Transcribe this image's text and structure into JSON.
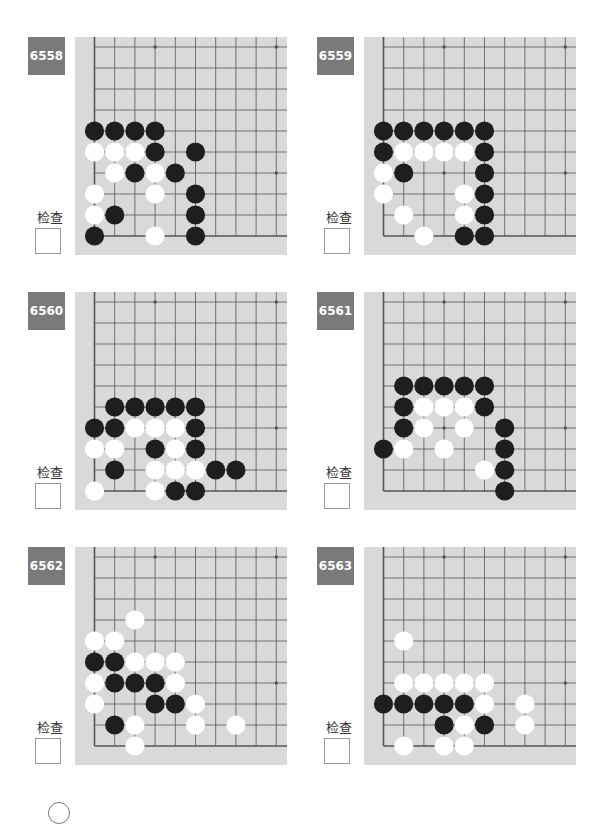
{
  "check_label": "检查",
  "colors": {
    "board_bg": "#d9d9d9",
    "label_bg": "#7a7a7a",
    "line": "#555555",
    "black_stone": "#1e1e1e",
    "white_stone": "#ffffff"
  },
  "board_geometry": {
    "cols": 10,
    "rows": 10,
    "col_spacing": 20.2,
    "row_spacing": 21,
    "origin_note": "bottom-left corner; col 0 = left edge, row 0 = bottom edge"
  },
  "star_points": [
    [
      3,
      9
    ],
    [
      9,
      9
    ],
    [
      3,
      3
    ],
    [
      9,
      3
    ]
  ],
  "problems": [
    {
      "number": "6558",
      "black": [
        [
          0,
          5
        ],
        [
          1,
          5
        ],
        [
          2,
          5
        ],
        [
          3,
          5
        ],
        [
          3,
          4
        ],
        [
          5,
          4
        ],
        [
          2,
          3
        ],
        [
          4,
          3
        ],
        [
          5,
          2
        ],
        [
          1,
          1
        ],
        [
          5,
          1
        ],
        [
          0,
          0
        ],
        [
          5,
          0
        ]
      ],
      "white": [
        [
          0,
          4
        ],
        [
          1,
          4
        ],
        [
          2,
          4
        ],
        [
          1,
          3
        ],
        [
          3,
          3
        ],
        [
          0,
          2
        ],
        [
          3,
          2
        ],
        [
          0,
          1
        ],
        [
          3,
          0
        ]
      ]
    },
    {
      "number": "6559",
      "black": [
        [
          0,
          5
        ],
        [
          1,
          5
        ],
        [
          2,
          5
        ],
        [
          3,
          5
        ],
        [
          4,
          5
        ],
        [
          5,
          5
        ],
        [
          0,
          4
        ],
        [
          5,
          4
        ],
        [
          1,
          3
        ],
        [
          5,
          3
        ],
        [
          5,
          2
        ],
        [
          5,
          1
        ],
        [
          4,
          0
        ],
        [
          5,
          0
        ]
      ],
      "white": [
        [
          1,
          4
        ],
        [
          2,
          4
        ],
        [
          3,
          4
        ],
        [
          4,
          4
        ],
        [
          0,
          3
        ],
        [
          0,
          2
        ],
        [
          4,
          2
        ],
        [
          1,
          1
        ],
        [
          4,
          1
        ],
        [
          2,
          0
        ]
      ]
    },
    {
      "number": "6560",
      "black": [
        [
          1,
          4
        ],
        [
          2,
          4
        ],
        [
          3,
          4
        ],
        [
          4,
          4
        ],
        [
          5,
          4
        ],
        [
          0,
          3
        ],
        [
          1,
          3
        ],
        [
          5,
          3
        ],
        [
          3,
          2
        ],
        [
          5,
          2
        ],
        [
          1,
          1
        ],
        [
          6,
          1
        ],
        [
          7,
          1
        ],
        [
          4,
          0
        ],
        [
          5,
          0
        ]
      ],
      "white": [
        [
          2,
          3
        ],
        [
          3,
          3
        ],
        [
          4,
          3
        ],
        [
          0,
          2
        ],
        [
          1,
          2
        ],
        [
          4,
          2
        ],
        [
          3,
          1
        ],
        [
          4,
          1
        ],
        [
          5,
          1
        ],
        [
          0,
          0
        ],
        [
          3,
          0
        ]
      ]
    },
    {
      "number": "6561",
      "black": [
        [
          1,
          5
        ],
        [
          2,
          5
        ],
        [
          3,
          5
        ],
        [
          4,
          5
        ],
        [
          5,
          5
        ],
        [
          1,
          4
        ],
        [
          5,
          4
        ],
        [
          1,
          3
        ],
        [
          6,
          3
        ],
        [
          0,
          2
        ],
        [
          6,
          2
        ],
        [
          6,
          1
        ],
        [
          6,
          0
        ]
      ],
      "white": [
        [
          2,
          4
        ],
        [
          3,
          4
        ],
        [
          4,
          4
        ],
        [
          2,
          3
        ],
        [
          4,
          3
        ],
        [
          1,
          2
        ],
        [
          3,
          2
        ],
        [
          5,
          1
        ]
      ]
    },
    {
      "number": "6562",
      "black": [
        [
          0,
          4
        ],
        [
          1,
          4
        ],
        [
          1,
          3
        ],
        [
          2,
          3
        ],
        [
          3,
          3
        ],
        [
          3,
          2
        ],
        [
          4,
          2
        ],
        [
          1,
          1
        ]
      ],
      "white": [
        [
          2,
          6
        ],
        [
          0,
          5
        ],
        [
          1,
          5
        ],
        [
          2,
          4
        ],
        [
          3,
          4
        ],
        [
          4,
          4
        ],
        [
          0,
          3
        ],
        [
          4,
          3
        ],
        [
          0,
          2
        ],
        [
          5,
          2
        ],
        [
          2,
          1
        ],
        [
          5,
          1
        ],
        [
          7,
          1
        ],
        [
          2,
          0
        ]
      ]
    },
    {
      "number": "6563",
      "black": [
        [
          0,
          2
        ],
        [
          1,
          2
        ],
        [
          2,
          2
        ],
        [
          3,
          2
        ],
        [
          4,
          2
        ],
        [
          3,
          1
        ],
        [
          5,
          1
        ]
      ],
      "white": [
        [
          1,
          5
        ],
        [
          1,
          3
        ],
        [
          2,
          3
        ],
        [
          3,
          3
        ],
        [
          4,
          3
        ],
        [
          5,
          3
        ],
        [
          5,
          2
        ],
        [
          7,
          2
        ],
        [
          4,
          1
        ],
        [
          7,
          1
        ],
        [
          1,
          0
        ],
        [
          3,
          0
        ],
        [
          4,
          0
        ]
      ]
    }
  ]
}
